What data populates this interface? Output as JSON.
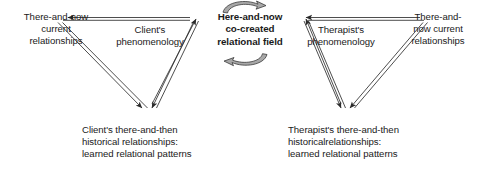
{
  "diagram": {
    "colors": {
      "line": "#3a3a3a",
      "text": "#1a1a1a",
      "curved_arrow_fill": "#a8a8a8",
      "background": "#ffffff"
    },
    "nodes": {
      "center": {
        "id": "center-field",
        "text": "Here-and-now\nco-created\nrelational field",
        "bold": true
      },
      "left_outer": {
        "id": "left-current-relationships",
        "text": "There-and-now\ncurrent\nrelationships"
      },
      "right_outer": {
        "id": "right-current-relationships",
        "text": "There-and-\nnow current\nrelationships"
      },
      "client_phenomenology": {
        "id": "client-phenomenology",
        "text": "Client's\nphenomenology"
      },
      "therapist_phenomenology": {
        "id": "therapist-phenomenology",
        "text": "Therapist's\nphenomenology"
      },
      "client_historical": {
        "id": "client-there-and-then",
        "text": "Client's there-and-then\nhistorical relationships:\nlearned relational patterns"
      },
      "therapist_historical": {
        "id": "therapist-there-and-then",
        "text": "Therapist's there-and-then\nhistoricalrelationships:\nlearned relational patterns"
      }
    },
    "connectors": [
      {
        "id": "left-top-edge",
        "from": "center-field",
        "to": "left-current-relationships",
        "style": "double-line",
        "arrowheads": [
          "to"
        ]
      },
      {
        "id": "left-down-edge",
        "from": "left-current-relationships",
        "to": "client-there-and-then",
        "style": "double-line",
        "arrowheads": [
          "to"
        ]
      },
      {
        "id": "left-up-edge",
        "from": "client-there-and-then",
        "to": "center-field",
        "style": "double-line",
        "arrowheads": [
          "from",
          "to"
        ]
      },
      {
        "id": "right-top-edge",
        "from": "right-current-relationships",
        "to": "center-field",
        "style": "double-line",
        "arrowheads": [
          "to"
        ]
      },
      {
        "id": "right-down-edge",
        "from": "right-current-relationships",
        "to": "therapist-there-and-then",
        "style": "double-line",
        "arrowheads": [
          "to"
        ]
      },
      {
        "id": "right-up-edge",
        "from": "therapist-there-and-then",
        "to": "center-field",
        "style": "double-line",
        "arrowheads": [
          "from",
          "to"
        ]
      },
      {
        "id": "curved-arrow-top",
        "shape": "curved-ribbon-arrow",
        "direction": "clockwise-right",
        "position": "above-center"
      },
      {
        "id": "curved-arrow-bottom",
        "shape": "curved-ribbon-arrow",
        "direction": "counterclockwise-left",
        "position": "below-center"
      }
    ]
  }
}
